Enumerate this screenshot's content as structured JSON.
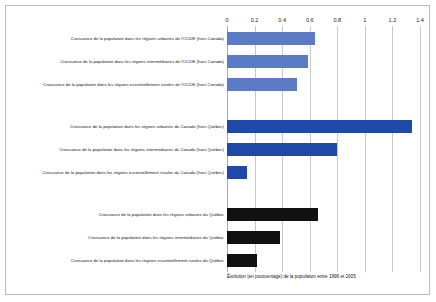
{
  "chart_data": {
    "type": "bar",
    "orientation": "horizontal",
    "title": "",
    "xlabel": "Évolution (en pourcentage) de la population entre 1996 et 2005",
    "ylabel": "",
    "xlim": [
      0,
      1.4
    ],
    "xticks": [
      "0",
      "0.2",
      "0.4",
      "0.6",
      "0.8",
      "1",
      "1.2",
      "1.4"
    ],
    "xtick_values": [
      0,
      0.2,
      0.4,
      0.6,
      0.8,
      1,
      1.2,
      1.4
    ],
    "grid": true,
    "legend": "none",
    "groups": [
      {
        "name": "OCDE (hors Canada)",
        "color": "#5B7CC4",
        "categories": [
          "Croissance de la population dans les régions urbaines de l'OCDE (hors Canada)",
          "Croissance de la population dans les régions intermédiaires de l'OCDE (hors Canada)",
          "Croissance de la population dans les régions essentiellement rurales de l'OCDE (hors Canada)"
        ],
        "values": [
          0.64,
          0.59,
          0.51
        ]
      },
      {
        "name": "Canada (hors Québec)",
        "color": "#1F49A8",
        "categories": [
          "Croissance de la population dans les régions urbaines du Canada (hors Québec)",
          "Croissance de la population dans les régions intermédiaires du Canada (hors Québec)",
          "Croissance de la population dans les régions essentiellement rurales du Canada (hors Québec)"
        ],
        "values": [
          1.34,
          0.8,
          0.145
        ]
      },
      {
        "name": "Québec",
        "color": "#111111",
        "categories": [
          "Croissance de la population dans les régions urbaines du Québec",
          "Croissance de la population dans les régions intermédiaires du Québec",
          "Croissance de la population dans les régions essentiellement rurales du Québec"
        ],
        "values": [
          0.66,
          0.385,
          0.215
        ]
      }
    ]
  },
  "caption": "Évolution (en pourcentage) de la population entre 1996 et 2005"
}
